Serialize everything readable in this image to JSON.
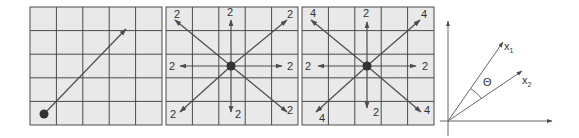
{
  "colors": {
    "grid_fill": "#e9e9e9",
    "grid_line": "#4a4a4a",
    "arrow": "#4d4d4d",
    "dot": "#333333",
    "label": "#333333"
  },
  "panels": [
    {
      "id": "panel-1",
      "description": "single diagonal vector from bottom-left dot",
      "grid": {
        "rows": 5,
        "cols": 5
      },
      "origin_cell": "bottom-left",
      "arrows": [
        {
          "direction": "up-right",
          "label": ""
        }
      ]
    },
    {
      "id": "panel-2",
      "description": "8 vectors from center, all magnitude 2",
      "grid": {
        "rows": 5,
        "cols": 5
      },
      "origin_cell": "center",
      "arrows": [
        {
          "direction": "up-left",
          "label": "2"
        },
        {
          "direction": "up",
          "label": "2"
        },
        {
          "direction": "up-right",
          "label": "2"
        },
        {
          "direction": "left",
          "label": "2"
        },
        {
          "direction": "right",
          "label": "2"
        },
        {
          "direction": "down-left",
          "label": "2"
        },
        {
          "direction": "down",
          "label": "2"
        },
        {
          "direction": "down-right",
          "label": "2"
        }
      ]
    },
    {
      "id": "panel-3",
      "description": "8 vectors from center, diagonals magnitude 4",
      "grid": {
        "rows": 5,
        "cols": 5
      },
      "origin_cell": "center",
      "arrows": [
        {
          "direction": "up-left",
          "label": "4"
        },
        {
          "direction": "up",
          "label": "2"
        },
        {
          "direction": "up-right",
          "label": "4"
        },
        {
          "direction": "left",
          "label": "2"
        },
        {
          "direction": "right",
          "label": "2"
        },
        {
          "direction": "down-left",
          "label": "4"
        },
        {
          "direction": "down",
          "label": "2"
        },
        {
          "direction": "down-right",
          "label": "4"
        }
      ]
    }
  ],
  "axes_diagram": {
    "vector_1_label": "x",
    "vector_1_subscript": "1",
    "vector_2_label": "x",
    "vector_2_subscript": "2",
    "angle_label": "Θ"
  }
}
